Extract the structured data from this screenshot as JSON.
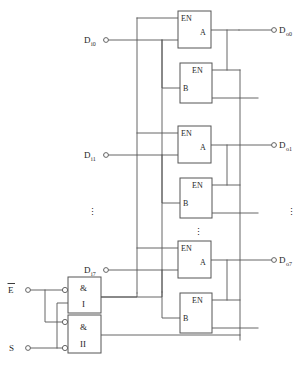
{
  "diagram": {
    "line_color": "#555555",
    "text_color": "#262626",
    "background": "#ffffff"
  },
  "channels": [
    {
      "input_label": "D",
      "input_sub": "i0",
      "output_label": "D",
      "output_sub": "o0",
      "buffer_a": {
        "enable_label": "EN",
        "name": "A"
      },
      "buffer_b": {
        "enable_label": "EN",
        "name": "B"
      }
    },
    {
      "input_label": "D",
      "input_sub": "i1",
      "output_label": "D",
      "output_sub": "o1",
      "buffer_a": {
        "enable_label": "EN",
        "name": "A"
      },
      "buffer_b": {
        "enable_label": "EN",
        "name": "B"
      }
    },
    {
      "input_label": "D",
      "input_sub": "i7",
      "output_label": "D",
      "output_sub": "o7",
      "buffer_a": {
        "enable_label": "EN",
        "name": "A"
      },
      "buffer_b": {
        "enable_label": "EN",
        "name": "B"
      }
    }
  ],
  "gates": [
    {
      "symbol": "&",
      "name": "I",
      "inverted_inputs": 1
    },
    {
      "symbol": "&",
      "name": "II",
      "inverted_inputs": 2
    }
  ],
  "control_inputs": [
    {
      "label": "E",
      "overline": true
    },
    {
      "label": "S",
      "overline": false
    }
  ],
  "ellipsis": {
    "glyph": "⋮",
    "count": 3
  }
}
